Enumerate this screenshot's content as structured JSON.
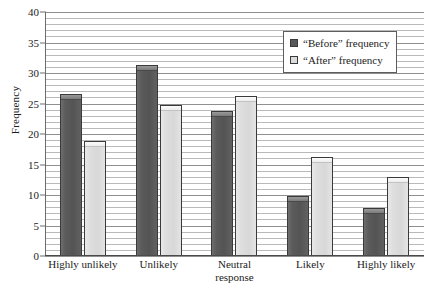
{
  "chart_data": {
    "type": "bar",
    "title": "",
    "xlabel": "",
    "ylabel": "Frequency",
    "categories": [
      "Highly unlikely",
      "Unlikely",
      "Neutral response",
      "Likely",
      "Highly likely"
    ],
    "category_lines": [
      [
        "Highly unlikely"
      ],
      [
        "Unlikely"
      ],
      [
        "Neutral",
        "response"
      ],
      [
        "Likely"
      ],
      [
        "Highly likely"
      ]
    ],
    "series": [
      {
        "name": "“Before” frequency",
        "color": "#585858",
        "values": [
          26.5,
          31.3,
          23.8,
          9.8,
          7.8
        ]
      },
      {
        "name": "“After” frequency",
        "color": "#dcdcdc",
        "values": [
          18.8,
          24.8,
          26.3,
          16.2,
          13.0
        ]
      }
    ],
    "ylim": [
      0,
      40
    ],
    "ytick_labels": [
      "0",
      "5",
      "10",
      "15",
      "20",
      "25",
      "30",
      "35",
      "40"
    ],
    "ytick_values": [
      0,
      5,
      10,
      15,
      20,
      25,
      30,
      35,
      40
    ],
    "minor_tick_step": 1,
    "grid": true,
    "legend_position": "top-right"
  },
  "legend": {
    "entries": [
      {
        "label": "“Before” frequency",
        "swatch": "before"
      },
      {
        "label": "“After” frequency",
        "swatch": "after"
      }
    ]
  }
}
